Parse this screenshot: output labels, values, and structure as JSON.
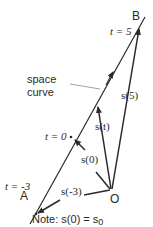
{
  "diagram": {
    "points": {
      "A": "A",
      "B": "B",
      "O": "O"
    },
    "parameter_labels": {
      "t_start": "t = -3",
      "t_zero": "t = 0",
      "t_end": "t = 5"
    },
    "vectors": {
      "s_minus3": "s(-3)",
      "s_zero": "s(0)",
      "s_t": "s(t)",
      "s_5": "s(5)"
    },
    "curve_label_line1": "space",
    "curve_label_line2": "curve",
    "note": "Note: s(0) = s",
    "note_subscript": "0"
  }
}
